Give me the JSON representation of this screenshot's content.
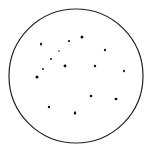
{
  "dish": {
    "cx": 76,
    "cy": 76,
    "r": 67,
    "stroke": "#222222",
    "fill": "#ffffff"
  },
  "colonies": [
    {
      "x": 41,
      "y": 44,
      "rx": 1.0,
      "ry": 1.6
    },
    {
      "x": 69,
      "y": 41,
      "rx": 1.1,
      "ry": 1.1
    },
    {
      "x": 82,
      "y": 37,
      "rx": 1.5,
      "ry": 1.5
    },
    {
      "x": 59,
      "y": 51,
      "rx": 0.8,
      "ry": 0.8
    },
    {
      "x": 105,
      "y": 50,
      "rx": 1.1,
      "ry": 1.2
    },
    {
      "x": 51,
      "y": 59,
      "rx": 1.0,
      "ry": 1.0
    },
    {
      "x": 43,
      "y": 69,
      "rx": 0.9,
      "ry": 0.9
    },
    {
      "x": 65,
      "y": 66,
      "rx": 1.4,
      "ry": 1.4
    },
    {
      "x": 95,
      "y": 66,
      "rx": 1.2,
      "ry": 1.2
    },
    {
      "x": 124,
      "y": 71,
      "rx": 1.0,
      "ry": 1.3
    },
    {
      "x": 37,
      "y": 77,
      "rx": 1.6,
      "ry": 1.6
    },
    {
      "x": 91,
      "y": 96,
      "rx": 1.3,
      "ry": 1.3
    },
    {
      "x": 116,
      "y": 99,
      "rx": 1.5,
      "ry": 1.3
    },
    {
      "x": 49,
      "y": 107,
      "rx": 1.2,
      "ry": 1.2
    },
    {
      "x": 75,
      "y": 113,
      "rx": 1.2,
      "ry": 1.8
    }
  ],
  "colony_color": "#111111"
}
